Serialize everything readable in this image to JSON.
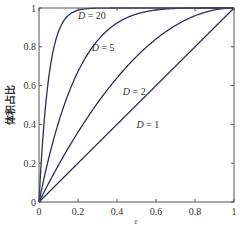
{
  "chart_data": {
    "type": "line",
    "title": "",
    "xlabel": "ε",
    "ylabel": "体积占比",
    "xlim": [
      0,
      1
    ],
    "ylim": [
      0,
      1
    ],
    "xticks": [
      0,
      0.2,
      0.4,
      0.6,
      0.8,
      1
    ],
    "xtick_labels": [
      "0",
      "0.2",
      "0.4",
      "0.6",
      "0.8",
      "1"
    ],
    "yticks": [
      0,
      0.2,
      0.4,
      0.6,
      0.8,
      1
    ],
    "ytick_labels": [
      "0",
      "0.2",
      "0.4",
      "0.6",
      "0.8",
      "1"
    ],
    "grid": false,
    "legend": "none",
    "formula": "y = 1 - (1 - ε)^D",
    "line_color": "#2b2d5a",
    "series": [
      {
        "name": "D = 1",
        "D": 1,
        "label_var": "D",
        "label_value": "= 1",
        "label_at": {
          "x": 0.5,
          "y": 0.38
        }
      },
      {
        "name": "D = 2",
        "D": 2,
        "label_var": "D",
        "label_value": "= 2",
        "label_at": {
          "x": 0.43,
          "y": 0.55
        }
      },
      {
        "name": "D = 5",
        "D": 5,
        "label_var": "D",
        "label_value": "= 5",
        "label_at": {
          "x": 0.27,
          "y": 0.78
        }
      },
      {
        "name": "D = 20",
        "D": 20,
        "label_var": "D",
        "label_value": "= 20",
        "label_at": {
          "x": 0.2,
          "y": 0.945
        }
      }
    ]
  }
}
